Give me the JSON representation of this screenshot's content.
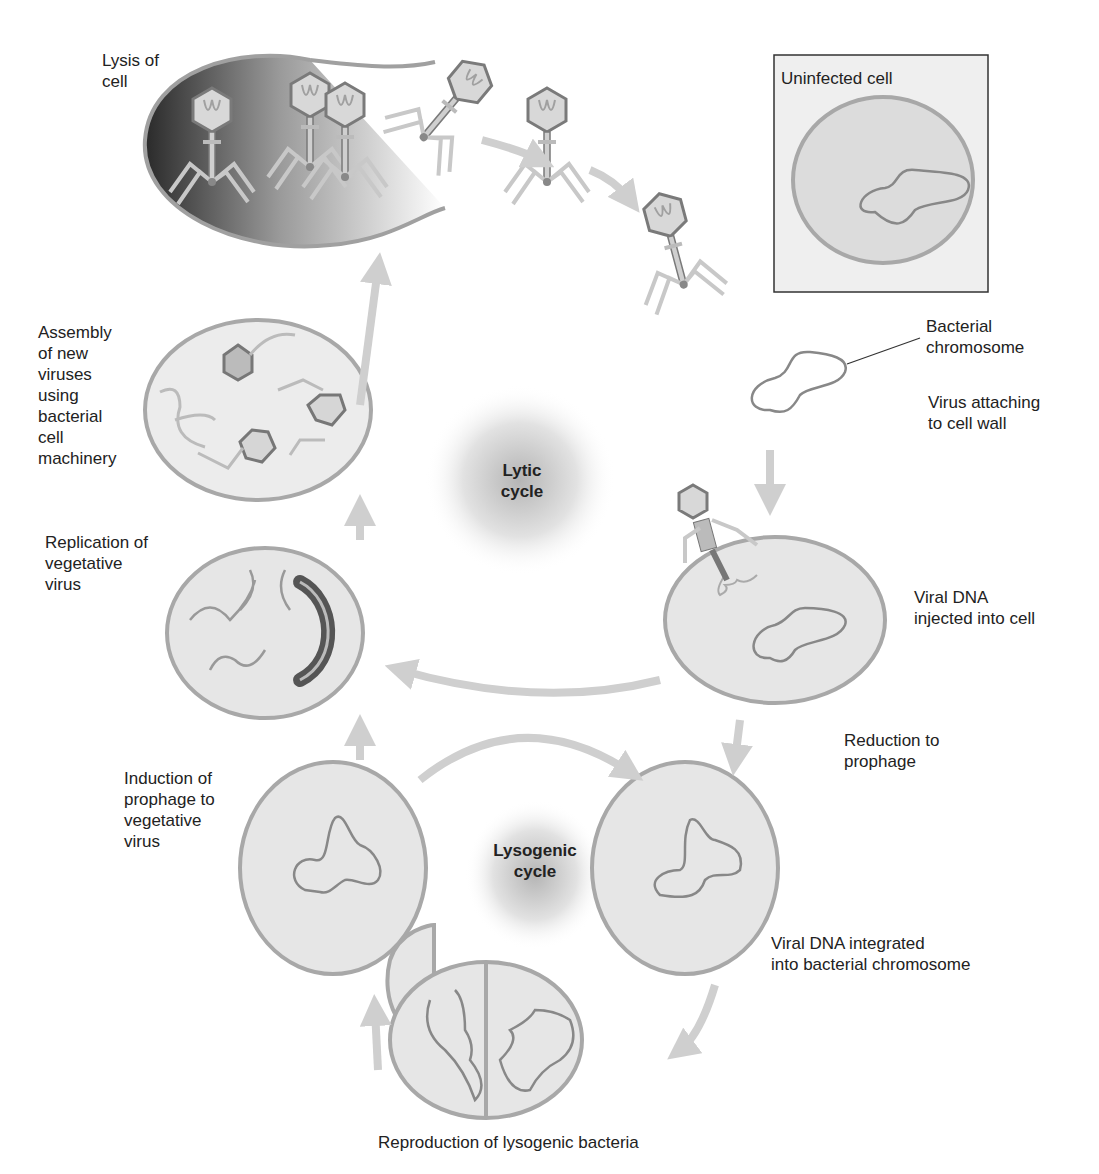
{
  "centers": {
    "lytic": "Lytic\ncycle",
    "lysogenic": "Lysogenic\ncycle"
  },
  "labels": {
    "lysis": "Lysis of\ncell",
    "uninfected": "Uninfected cell",
    "bacterial_chromosome": "Bacterial\nchromosome",
    "virus_attaching": "Virus attaching\nto cell wall",
    "viral_dna_injected": "Viral DNA\ninjected into cell",
    "reduction": "Reduction to\nprophage",
    "integrated": "Viral DNA integrated\ninto bacterial chromosome",
    "reproduction": "Reproduction of lysogenic bacteria",
    "induction": "Induction of\nprophage to\nvegetative\nvirus",
    "replication": "Replication of\nvegetative\nvirus",
    "assembly": "Assembly\nof new\nviruses\nusing\nbacterial\ncell\nmachinery"
  },
  "colors": {
    "cell_fill": "#e6e6e6",
    "cell_stroke": "#a8a8a8",
    "dna": "#8a8a8a",
    "arrow": "#cfcfcf",
    "phage": "#7a7a7a"
  }
}
